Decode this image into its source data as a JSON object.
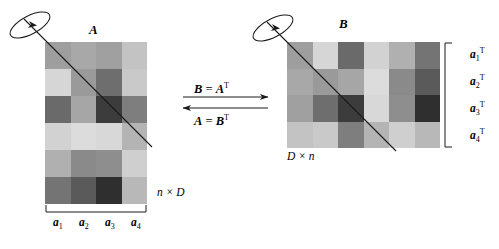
{
  "figure": {
    "matrix_a": {
      "name": "A",
      "dim_label": "n × D",
      "rows": 6,
      "cols": 4,
      "column_labels": [
        "a1",
        "a2",
        "a3",
        "a4"
      ],
      "column_label_parts": [
        {
          "base": "a",
          "sub": "1"
        },
        {
          "base": "a",
          "sub": "2"
        },
        {
          "base": "a",
          "sub": "3"
        },
        {
          "base": "a",
          "sub": "4"
        }
      ],
      "cells": [
        [
          "#9e9e9e",
          "#a8a8a8",
          "#a0a0a0",
          "#c3c3c3"
        ],
        [
          "#d6d6d6",
          "#9a9a9a",
          "#6e6e6e",
          "#c9c9c9"
        ],
        [
          "#6a6a6a",
          "#a6a6a6",
          "#3c3c3c",
          "#7e7e7e"
        ],
        [
          "#d2d2d2",
          "#dcdcdc",
          "#d8d8d8",
          "#b4b4b4"
        ],
        [
          "#b0b0b0",
          "#8a8a8a",
          "#8e8e8e",
          "#cfcfcf"
        ],
        [
          "#747474",
          "#5a5a5a",
          "#2f2f2f",
          "#b8b8b8"
        ]
      ]
    },
    "matrix_b": {
      "name": "B",
      "dim_label": "D × n",
      "rows": 4,
      "cols": 6,
      "row_labels": [
        "a1T",
        "a2T",
        "a3T",
        "a4T"
      ],
      "row_label_parts": [
        {
          "base": "a",
          "sub": "1",
          "sup": "T"
        },
        {
          "base": "a",
          "sub": "2",
          "sup": "T"
        },
        {
          "base": "a",
          "sub": "3",
          "sup": "T"
        },
        {
          "base": "a",
          "sub": "4",
          "sup": "T"
        }
      ],
      "cells": [
        [
          "#9e9e9e",
          "#d6d6d6",
          "#6a6a6a",
          "#d2d2d2",
          "#b0b0b0",
          "#747474"
        ],
        [
          "#a8a8a8",
          "#9a9a9a",
          "#a6a6a6",
          "#dcdcdc",
          "#8a8a8a",
          "#5a5a5a"
        ],
        [
          "#a0a0a0",
          "#6e6e6e",
          "#3c3c3c",
          "#d8d8d8",
          "#8e8e8e",
          "#2f2f2f"
        ],
        [
          "#c3c3c3",
          "#c9c9c9",
          "#7e7e7e",
          "#b4b4b4",
          "#cfcfcf",
          "#b8b8b8"
        ]
      ]
    },
    "equations": {
      "top": {
        "lhs": "B",
        "op": " = ",
        "rhs": "A",
        "exponent": "T"
      },
      "bottom": {
        "lhs": "A",
        "op": " = ",
        "rhs": "B",
        "exponent": "T"
      }
    },
    "colors": {
      "background": "#ffffff",
      "stroke": "#1a1a1a"
    }
  }
}
